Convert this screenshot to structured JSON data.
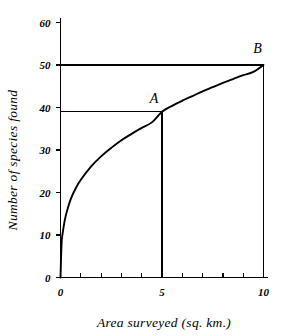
{
  "chart_data": {
    "type": "line",
    "title": "",
    "xlabel": "Area surveyed (sq. km.)",
    "ylabel": "Number of species found",
    "xlim": [
      0,
      10
    ],
    "ylim": [
      0,
      60
    ],
    "grid": false,
    "legend": null,
    "x_ticks_major": [
      0,
      5,
      10
    ],
    "x_tick_labels": [
      "0",
      "5",
      "10"
    ],
    "x_ticks_minor": [
      1,
      2,
      3,
      4,
      6,
      7,
      8,
      9
    ],
    "y_ticks": [
      0,
      10,
      20,
      30,
      40,
      50,
      60
    ],
    "y_tick_labels": [
      "0",
      "10",
      "20",
      "30",
      "40",
      "50",
      "60"
    ],
    "series": [
      {
        "name": "species-area curve",
        "x": [
          0,
          0.05,
          0.1,
          0.2,
          0.3,
          0.5,
          0.75,
          1,
          1.5,
          2,
          2.5,
          3,
          3.5,
          4,
          4.5,
          5,
          5.5,
          6,
          6.5,
          7,
          7.5,
          8,
          8.5,
          9,
          9.5,
          10
        ],
        "y": [
          0,
          7.8,
          10.2,
          13.2,
          15.3,
          18.4,
          21.0,
          23.0,
          26.1,
          28.5,
          30.5,
          32.3,
          33.8,
          35.2,
          36.5,
          39.0,
          40.4,
          41.6,
          42.7,
          43.8,
          44.8,
          45.8,
          46.7,
          47.6,
          48.4,
          50.0
        ]
      }
    ],
    "annotations": [
      {
        "label": "A",
        "x": 5,
        "y": 39,
        "note": "5 sq. km. gives 39 species"
      },
      {
        "label": "B",
        "x": 10,
        "y": 50,
        "note": "10 sq. km. gives 50 species"
      }
    ],
    "reference_lines": [
      {
        "from": [
          0,
          39
        ],
        "to": [
          5,
          39
        ],
        "orientation": "horizontal"
      },
      {
        "from": [
          5,
          0
        ],
        "to": [
          5,
          39
        ],
        "orientation": "vertical"
      },
      {
        "from": [
          0,
          50
        ],
        "to": [
          10,
          50
        ],
        "orientation": "horizontal"
      },
      {
        "from": [
          10,
          0
        ],
        "to": [
          10,
          50
        ],
        "orientation": "vertical"
      }
    ]
  }
}
